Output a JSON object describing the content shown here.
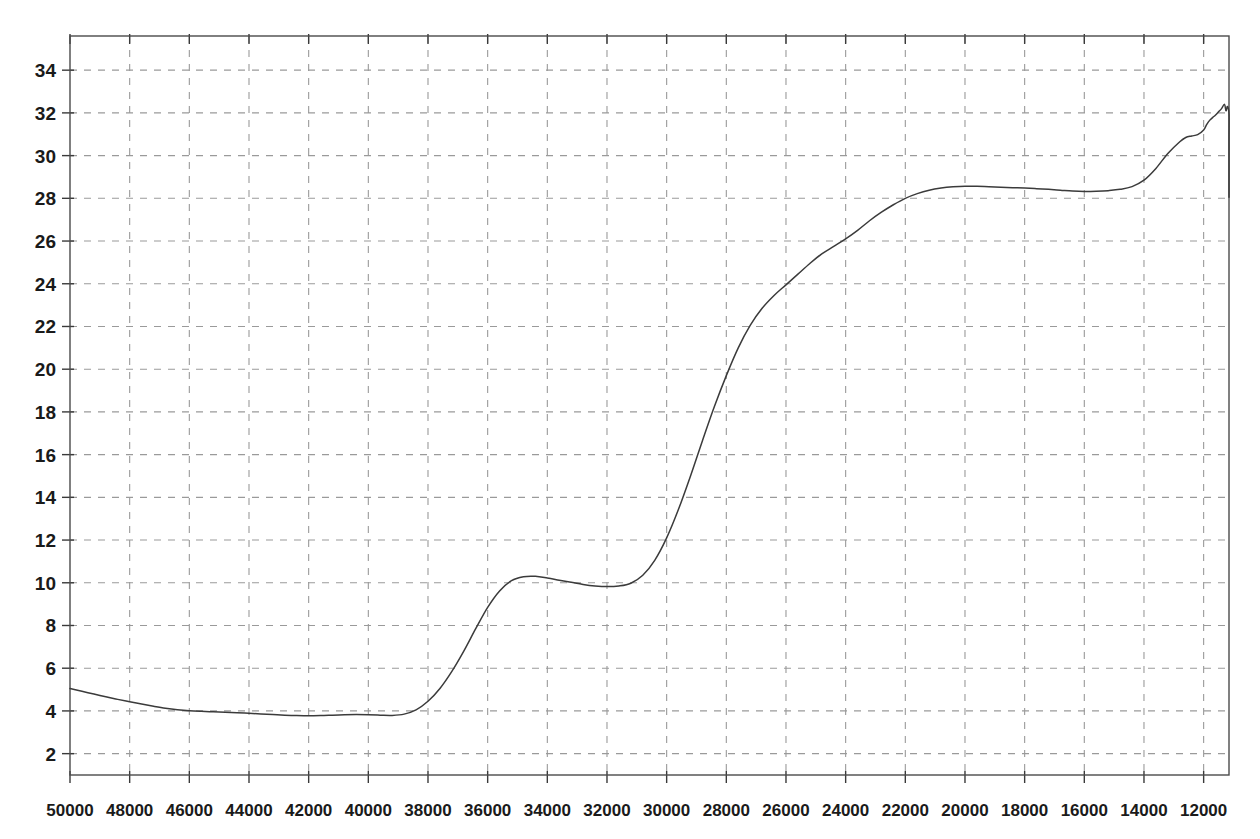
{
  "chart_data": {
    "type": "line",
    "title": "",
    "subtitle": "",
    "xlabel": "",
    "ylabel": "",
    "xlim": [
      50000,
      11150
    ],
    "ylim": [
      1.0,
      35.6
    ],
    "x_reversed": true,
    "grid": true,
    "legend": null,
    "legend_position": "none",
    "x_tick_labels": [
      "50000",
      "48000",
      "46000",
      "44000",
      "42000",
      "40000",
      "38000",
      "36000",
      "34000",
      "32000",
      "30000",
      "28000",
      "26000",
      "24000",
      "22000",
      "20000",
      "18000",
      "16000",
      "14000",
      "12000"
    ],
    "x_ticks": [
      50000,
      48000,
      46000,
      44000,
      42000,
      40000,
      38000,
      36000,
      34000,
      32000,
      30000,
      28000,
      26000,
      24000,
      22000,
      20000,
      18000,
      16000,
      14000,
      12000
    ],
    "y_tick_labels": [
      "34",
      "32",
      "30",
      "28",
      "26",
      "24",
      "22",
      "20",
      "18",
      "16",
      "14",
      "12",
      "10",
      "8",
      "6",
      "4",
      "2"
    ],
    "y_ticks": [
      34,
      32,
      30,
      28,
      26,
      24,
      22,
      20,
      18,
      16,
      14,
      12,
      10,
      8,
      6,
      4,
      2
    ],
    "series": [
      {
        "name": "transmittance",
        "color": "#3b3b3b",
        "x": [
          50000,
          49600,
          49200,
          48800,
          48400,
          48000,
          47600,
          47200,
          46800,
          46400,
          46000,
          45600,
          45200,
          44800,
          44400,
          44000,
          43600,
          43200,
          42800,
          42400,
          42000,
          41600,
          41200,
          40800,
          40400,
          40000,
          39600,
          39200,
          38800,
          38400,
          38000,
          37600,
          37200,
          36800,
          36400,
          36000,
          35600,
          35200,
          34800,
          34400,
          34000,
          33600,
          33200,
          32800,
          32400,
          32000,
          31600,
          31200,
          30800,
          30400,
          30000,
          29600,
          29200,
          28800,
          28400,
          28000,
          27600,
          27200,
          26800,
          26400,
          26000,
          25600,
          25200,
          24800,
          24400,
          24000,
          23600,
          23200,
          22800,
          22400,
          22000,
          21600,
          21200,
          20800,
          20400,
          20000,
          19600,
          19200,
          18800,
          18400,
          18000,
          17600,
          17200,
          16800,
          16400,
          16000,
          15600,
          15200,
          14800,
          14400,
          14000,
          13600,
          13200,
          12800,
          12600,
          12400,
          12200,
          12000,
          11900,
          11800,
          11700,
          11600,
          11500,
          11400,
          11300,
          11250,
          11200,
          11150
        ],
        "y": [
          5.05,
          4.92,
          4.79,
          4.66,
          4.54,
          4.43,
          4.32,
          4.22,
          4.13,
          4.06,
          4.01,
          3.98,
          3.96,
          3.94,
          3.92,
          3.89,
          3.86,
          3.83,
          3.8,
          3.78,
          3.77,
          3.78,
          3.8,
          3.82,
          3.83,
          3.82,
          3.8,
          3.79,
          3.85,
          4.05,
          4.45,
          5.05,
          5.85,
          6.8,
          7.85,
          8.85,
          9.62,
          10.1,
          10.28,
          10.3,
          10.22,
          10.12,
          10.02,
          9.92,
          9.85,
          9.82,
          9.85,
          9.98,
          10.35,
          11.05,
          12.1,
          13.45,
          15.0,
          16.65,
          18.25,
          19.7,
          21.0,
          22.05,
          22.85,
          23.45,
          23.95,
          24.45,
          24.95,
          25.4,
          25.75,
          26.1,
          26.5,
          26.95,
          27.35,
          27.7,
          28.0,
          28.22,
          28.38,
          28.48,
          28.54,
          28.57,
          28.56,
          28.54,
          28.52,
          28.5,
          28.48,
          28.45,
          28.42,
          28.38,
          28.34,
          28.32,
          28.33,
          28.36,
          28.42,
          28.55,
          28.85,
          29.4,
          30.1,
          30.65,
          30.85,
          30.92,
          30.98,
          31.2,
          31.45,
          31.65,
          31.78,
          31.9,
          32.05,
          32.2,
          32.4,
          32.1,
          32.3,
          31.95
        ],
        "y_tail": [
          31.95,
          30.9,
          29.6,
          28.6,
          28.05
        ]
      }
    ],
    "annotations": []
  },
  "plot_geometry": {
    "left_px": 70,
    "right_px": 1229,
    "top_px": 36,
    "bottom_px": 775,
    "y_top_value": 35.6,
    "y_bottom_value": 1.0,
    "x_left_value": 50000,
    "x_right_value": 11150
  }
}
